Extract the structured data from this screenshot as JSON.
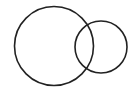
{
  "diagram": {
    "type": "venn",
    "background": "#ffffff",
    "stroke_color": "#222222",
    "stroke_width": 1.6,
    "circles": [
      {
        "name": "large-circle",
        "cx": 54,
        "cy": 46,
        "r": 39.5
      },
      {
        "name": "small-circle",
        "cx": 101,
        "cy": 47,
        "r": 26
      }
    ]
  }
}
